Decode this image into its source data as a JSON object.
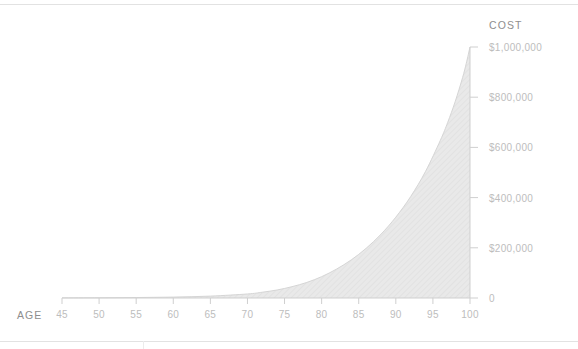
{
  "chart_data": {
    "type": "area",
    "title": "",
    "xlabel": "AGE",
    "ylabel": "COST",
    "xlim": [
      45,
      100
    ],
    "ylim": [
      0,
      1000000
    ],
    "grid": false,
    "legend": null,
    "x_ticks": [
      "45",
      "50",
      "55",
      "60",
      "65",
      "70",
      "75",
      "80",
      "85",
      "90",
      "95",
      "100"
    ],
    "x_tick_values": [
      45,
      50,
      55,
      60,
      65,
      70,
      75,
      80,
      85,
      90,
      95,
      100
    ],
    "y_ticks": [
      "0",
      "$200,000",
      "$400,000",
      "$600,000",
      "$800,000",
      "$1,000,000"
    ],
    "y_tick_values": [
      0,
      200000,
      400000,
      600000,
      800000,
      1000000
    ],
    "series": [
      {
        "name": "Cost",
        "x": [
          45,
          50,
          55,
          60,
          65,
          70,
          72,
          74,
          76,
          78,
          80,
          82,
          84,
          86,
          88,
          90,
          92,
          94,
          96,
          97,
          98,
          99,
          99.5,
          100
        ],
        "values": [
          500,
          900,
          1800,
          3600,
          7500,
          16000,
          23000,
          32000,
          45000,
          62000,
          85000,
          115000,
          152000,
          198000,
          254000,
          322000,
          404000,
          504000,
          628000,
          700000,
          782000,
          878000,
          935000,
          1000000
        ],
        "fill_color": "#e7e7e7",
        "line_color": "#d8d8d8"
      }
    ]
  },
  "axes": {
    "x_axis_color": "#cfcfcf",
    "y_axis_color": "#cfcfcf",
    "tick_label_color": "#bdbdbd",
    "axis_title_color": "#8e8e8e"
  },
  "frame": {
    "border_color": "#e2e2e2"
  }
}
